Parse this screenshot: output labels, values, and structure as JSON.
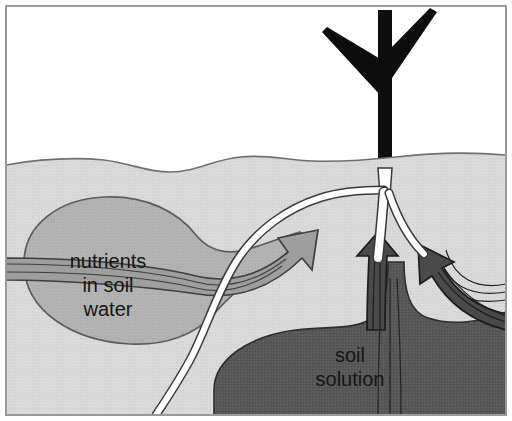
{
  "figure": {
    "name": "soil-nutrient-uptake-diagram",
    "type": "cross-section illustration",
    "frame_border_color": "#9a9a9a",
    "background_color": "#ffffff"
  },
  "labels": {
    "nutrients": {
      "lines": [
        "nutrients",
        "in soil",
        "water"
      ],
      "line1": "nutrients",
      "line2": "in soil",
      "line3": "water",
      "color": "#151515"
    },
    "soil_solution": {
      "lines": [
        "soil",
        "solution"
      ],
      "line1": "soil",
      "line2": "solution",
      "color": "#151515"
    }
  },
  "regions": {
    "sky": {
      "name": "sky-above-ground",
      "color": "#ffffff"
    },
    "soil": {
      "name": "soil-body",
      "color": "#d7d7d7",
      "surface_line_color": "#6f6f6f"
    },
    "nutrient_blob": {
      "name": "nutrients-in-soil-water-blob",
      "color": "#b2b2b2",
      "outline_color": "#5d5d5d"
    },
    "soil_solution_mass": {
      "name": "soil-solution-mass",
      "color": "#565656",
      "outline_color": "#2e2e2e"
    }
  },
  "plant": {
    "stem": {
      "name": "plant-stem",
      "color": "#0d0d0d"
    },
    "roots": {
      "name": "root-system",
      "color": "#ffffff",
      "outline_color": "#3a3a3a",
      "count": 3
    }
  },
  "arrows": {
    "nutrient_flow": {
      "name": "nutrient-uptake-arrow",
      "color": "#9e9e9e",
      "outline_color": "#3f3f3f",
      "direction": "up-right",
      "count": 1
    },
    "solution_flow_center": {
      "name": "soil-solution-uptake-arrow-center",
      "color": "#4a4a4a",
      "outline_color": "#1c1c1c",
      "direction": "up",
      "count": 1
    },
    "solution_flow_right": {
      "name": "soil-solution-uptake-arrow-right",
      "color": "#4a4a4a",
      "outline_color": "#1c1c1c",
      "direction": "up-left",
      "count": 1
    }
  }
}
